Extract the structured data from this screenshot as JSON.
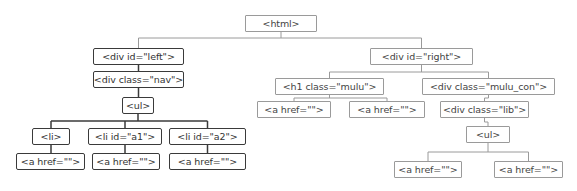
{
  "diagram": {
    "nodes": [
      {
        "id": "html",
        "label": "<html>",
        "x": 245,
        "y": 15,
        "w": 72,
        "h": 17,
        "style": "light"
      },
      {
        "id": "div_left",
        "label": "<div id=\"left\">",
        "x": 93,
        "y": 48,
        "w": 91,
        "h": 17,
        "style": "dark"
      },
      {
        "id": "div_nav",
        "label": "<div class=\"nav\">",
        "x": 93,
        "y": 71,
        "w": 91,
        "h": 17,
        "style": "dark"
      },
      {
        "id": "ul_left",
        "label": "<ul>",
        "x": 122,
        "y": 97,
        "w": 32,
        "h": 17,
        "style": "dark"
      },
      {
        "id": "li",
        "label": "<li>",
        "x": 32,
        "y": 128,
        "w": 38,
        "h": 17,
        "style": "dark"
      },
      {
        "id": "li_a1",
        "label": "<li id=\"a1\">",
        "x": 88,
        "y": 128,
        "w": 74,
        "h": 17,
        "style": "dark"
      },
      {
        "id": "li_a2",
        "label": "<li id=\"a2\">",
        "x": 169,
        "y": 128,
        "w": 77,
        "h": 17,
        "style": "dark"
      },
      {
        "id": "a_l1",
        "label": "<a href=\"\">",
        "x": 16,
        "y": 153,
        "w": 69,
        "h": 17,
        "style": "dark"
      },
      {
        "id": "a_l2",
        "label": "<a href=\"\">",
        "x": 92,
        "y": 153,
        "w": 68,
        "h": 17,
        "style": "dark"
      },
      {
        "id": "a_l3",
        "label": "<a href=\"\">",
        "x": 169,
        "y": 153,
        "w": 77,
        "h": 17,
        "style": "dark"
      },
      {
        "id": "div_right",
        "label": "<div id=\"right\">",
        "x": 370,
        "y": 48,
        "w": 103,
        "h": 17,
        "style": "light"
      },
      {
        "id": "h1_mulu",
        "label": "<h1 class=\"mulu\">",
        "x": 275,
        "y": 78,
        "w": 109,
        "h": 17,
        "style": "light"
      },
      {
        "id": "div_mulu_con",
        "label": "<div class=\"mulu_con\">",
        "x": 422,
        "y": 78,
        "w": 133,
        "h": 17,
        "style": "light"
      },
      {
        "id": "a_r1",
        "label": "<a href=\"\">",
        "x": 257,
        "y": 101,
        "w": 74,
        "h": 17,
        "style": "light"
      },
      {
        "id": "a_r2",
        "label": "<a href=\"\">",
        "x": 349,
        "y": 101,
        "w": 76,
        "h": 17,
        "style": "light"
      },
      {
        "id": "div_lib",
        "label": "<div class=\"lib\">",
        "x": 440,
        "y": 101,
        "w": 89,
        "h": 17,
        "style": "light"
      },
      {
        "id": "ul_right",
        "label": "<ul>",
        "x": 466,
        "y": 126,
        "w": 44,
        "h": 17,
        "style": "light"
      },
      {
        "id": "a_r3",
        "label": "<a href=\"\">",
        "x": 394,
        "y": 161,
        "w": 68,
        "h": 17,
        "style": "light"
      },
      {
        "id": "a_r4",
        "label": "<a href=\"\">",
        "x": 494,
        "y": 161,
        "w": 69,
        "h": 17,
        "style": "light"
      }
    ],
    "edges": [
      [
        "html",
        "div_left"
      ],
      [
        "html",
        "div_right"
      ],
      [
        "div_left",
        "div_nav"
      ],
      [
        "div_nav",
        "ul_left"
      ],
      [
        "ul_left",
        "li"
      ],
      [
        "ul_left",
        "li_a1"
      ],
      [
        "ul_left",
        "li_a2"
      ],
      [
        "li",
        "a_l1"
      ],
      [
        "li_a1",
        "a_l2"
      ],
      [
        "li_a2",
        "a_l3"
      ],
      [
        "div_right",
        "h1_mulu"
      ],
      [
        "div_right",
        "div_mulu_con"
      ],
      [
        "h1_mulu",
        "a_r1"
      ],
      [
        "h1_mulu",
        "a_r2"
      ],
      [
        "div_mulu_con",
        "div_lib"
      ],
      [
        "div_lib",
        "ul_right"
      ],
      [
        "ul_right",
        "a_r3"
      ],
      [
        "ul_right",
        "a_r4"
      ]
    ],
    "colors": {
      "dark_line": "#3a3a3a",
      "light_line": "#9a9a9a"
    }
  }
}
